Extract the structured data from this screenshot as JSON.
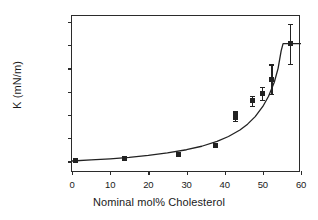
{
  "chart_data": {
    "type": "scatter",
    "title": "",
    "xlabel": "Nominal mol% Cholesterol",
    "ylabel": "K (mN/m)",
    "xlim": [
      0,
      60
    ],
    "ylim": [
      100,
      1450
    ],
    "xticks": [
      0,
      10,
      20,
      30,
      40,
      50,
      60
    ],
    "yticks": [
      200,
      400,
      600,
      800,
      1000,
      1200,
      1400
    ],
    "grid": false,
    "legend": null,
    "marker": "filled-square",
    "marker_color": "#222222",
    "line_color": "#222222",
    "series": [
      {
        "name": "K vs cholesterol",
        "points": [
          {
            "x": 0.8,
            "y": 205,
            "yerr": 0
          },
          {
            "x": 13.8,
            "y": 228,
            "yerr": 0
          },
          {
            "x": 27.8,
            "y": 258,
            "yerr": 0
          },
          {
            "x": 37.7,
            "y": 340,
            "yerr": 0
          },
          {
            "x": 42.8,
            "y": 578,
            "yerr": 28
          },
          {
            "x": 42.8,
            "y": 607,
            "yerr": 30
          },
          {
            "x": 47.4,
            "y": 720,
            "yerr": 42
          },
          {
            "x": 49.9,
            "y": 785,
            "yerr": 58
          },
          {
            "x": 52.4,
            "y": 905,
            "yerr": 128
          },
          {
            "x": 57.3,
            "y": 1212,
            "yerr": 172
          }
        ]
      }
    ],
    "fit_curve": {
      "name": "fitted curve",
      "points": [
        {
          "x": 0.0,
          "y": 203
        },
        {
          "x": 5.0,
          "y": 212
        },
        {
          "x": 10.0,
          "y": 222
        },
        {
          "x": 15.0,
          "y": 235
        },
        {
          "x": 20.0,
          "y": 252
        },
        {
          "x": 25.0,
          "y": 273
        },
        {
          "x": 30.0,
          "y": 300
        },
        {
          "x": 34.0,
          "y": 330
        },
        {
          "x": 38.0,
          "y": 372
        },
        {
          "x": 41.0,
          "y": 414
        },
        {
          "x": 44.0,
          "y": 470
        },
        {
          "x": 46.0,
          "y": 520
        },
        {
          "x": 48.0,
          "y": 585
        },
        {
          "x": 50.0,
          "y": 672
        },
        {
          "x": 51.5,
          "y": 760
        },
        {
          "x": 53.0,
          "y": 880
        },
        {
          "x": 54.0,
          "y": 1000
        },
        {
          "x": 54.8,
          "y": 1150
        },
        {
          "x": 55.3,
          "y": 1212
        },
        {
          "x": 60.0,
          "y": 1212
        }
      ]
    }
  },
  "axes": {
    "x_tick_labels": [
      "0",
      "10",
      "20",
      "30",
      "40",
      "50",
      "60"
    ],
    "y_tick_labels": [
      "200",
      "400",
      "600",
      "800",
      "1000",
      "1200",
      "1400"
    ],
    "x_title": "Nominal mol% Cholesterol",
    "y_title": "K (mN/m)"
  }
}
